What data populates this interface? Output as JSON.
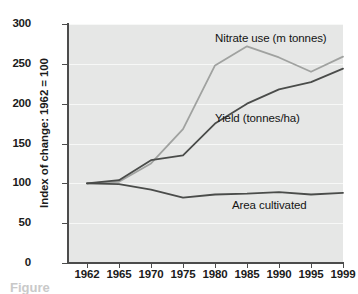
{
  "chart_data": {
    "type": "line",
    "title": "",
    "xlabel": "",
    "ylabel": "Index of change: 1962 = 100",
    "categories": [
      "1962",
      "1965",
      "1970",
      "1975",
      "1980",
      "1985",
      "1990",
      "1995",
      "1999"
    ],
    "ylim": [
      0,
      300
    ],
    "yticks": [
      0,
      50,
      100,
      150,
      200,
      250,
      300
    ],
    "ytick_labels": [
      "0",
      "50",
      "100",
      "150",
      "200",
      "250",
      "300"
    ],
    "grid": "horizontal",
    "legend": "inline-annotations",
    "series": [
      {
        "name": "Nitrate use (m tonnes)",
        "color": "#a0a2a0",
        "values": [
          100,
          102,
          125,
          168,
          248,
          272,
          258,
          240,
          259
        ],
        "annotation": "Nitrate use (m tonnes)"
      },
      {
        "name": "Yield (tonnes/ha)",
        "color": "#4a4c4a",
        "values": [
          100,
          104,
          129,
          135,
          175,
          200,
          218,
          227,
          244
        ],
        "annotation": "Yield (tonnes/ha)"
      },
      {
        "name": "Area cultivated",
        "color": "#4a4c4a",
        "values": [
          100,
          99,
          92,
          82,
          86,
          87,
          89,
          86,
          88
        ],
        "annotation": "Area cultivated"
      }
    ]
  },
  "annotations": {
    "nitrate_label": "Nitrate use (m tonnes)",
    "yield_label": "Yield (tonnes/ha)",
    "area_label": "Area cultivated"
  },
  "axis": {
    "y_title": "Index of change: 1962 = 100"
  },
  "caption": {
    "text": "Figure"
  },
  "colors": {
    "plot_background": "#e6e7e6",
    "gridline": "#f7f8f7",
    "axis": "#4c4c4c",
    "series_light": "#a0a2a0",
    "series_dark": "#4a4c4a",
    "text": "#1b1b1b"
  }
}
